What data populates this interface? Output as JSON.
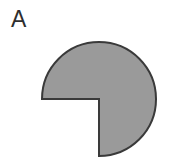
{
  "figure": {
    "panel_label": "A",
    "background_color": "#ffffff",
    "width": 184,
    "height": 164
  },
  "shape": {
    "name": "notched-circle",
    "description": "Filled circle with a 90 degree quarter wedge removed from the lower-left quadrant",
    "fill_color": "#9a9a9a",
    "stroke_color": "#3a3a3a",
    "stroke_width": 2,
    "center_x": 99,
    "center_y": 99,
    "radius": 57,
    "notch_start_angle_deg": 180,
    "notch_end_angle_deg": 270,
    "notch_span_deg": 90,
    "path": "M 42 99 L 99 99 L 99 156 A 57 57 0 1 0 42 99 Z"
  }
}
